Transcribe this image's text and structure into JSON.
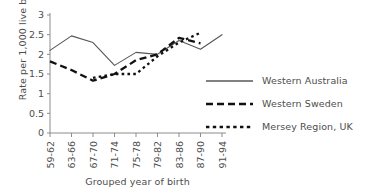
{
  "chart_data": {
    "type": "line",
    "title": "",
    "subtitle": "",
    "xlabel": "Grouped year of birth",
    "ylabel": "Rate per 1,000 live births",
    "categories": [
      "59-62",
      "63-66",
      "67-70",
      "71-74",
      "75-78",
      "79-82",
      "83-86",
      "87-90",
      "91-94"
    ],
    "ylim": [
      0,
      3
    ],
    "yticks": [
      "0",
      "0.5",
      "1",
      "1.5",
      "2",
      "2.5",
      "3"
    ],
    "ytick_values": [
      0,
      0.5,
      1,
      1.5,
      2,
      2.5,
      3
    ],
    "grid": false,
    "legend_position": "right-middle",
    "series": [
      {
        "name": "Western Australia",
        "style": "solid",
        "values": [
          2.1,
          2.47,
          2.3,
          1.72,
          2.05,
          2.0,
          2.35,
          2.13,
          2.5
        ]
      },
      {
        "name": "Western Sweden",
        "style": "long-dash",
        "values": [
          1.82,
          1.6,
          1.33,
          1.5,
          1.85,
          2.0,
          2.42,
          2.28,
          null
        ]
      },
      {
        "name": "Mersey Region, UK",
        "style": "short-dash",
        "values": [
          null,
          null,
          1.4,
          1.5,
          1.5,
          1.95,
          2.3,
          2.55,
          null
        ]
      }
    ]
  },
  "legend": {
    "items": [
      {
        "label": "Western Australia",
        "style": "solid"
      },
      {
        "label": "Western Sweden",
        "style": "long-dash"
      },
      {
        "label": "Mersey Region, UK",
        "style": "short-dash"
      }
    ]
  },
  "colors": {
    "series_western_australia": "#575757",
    "series_western_sweden": "#111111",
    "series_mersey": "#111111",
    "axis": "#8c8c8c",
    "text": "#4d4d4d",
    "background": "#ffffff"
  }
}
